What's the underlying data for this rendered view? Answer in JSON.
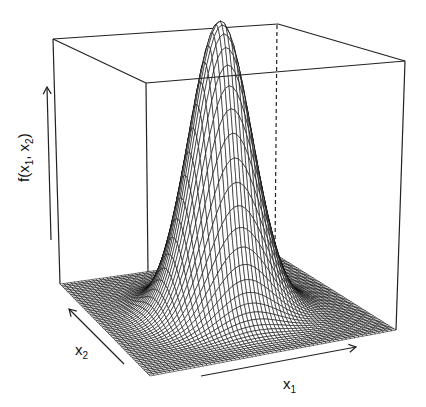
{
  "chart_data": {
    "type": "surface3d",
    "title": "",
    "function": "bivariate standard normal density f(x1, x2)",
    "xlabel": "x1",
    "ylabel": "x2",
    "zlabel": "f(x1, x2)",
    "axis_labels": {
      "x": {
        "base": "x",
        "sub": "1"
      },
      "y": {
        "base": "x",
        "sub": "2"
      },
      "z": {
        "base": "f(x",
        "sub1": "1",
        "mid": ", x",
        "sub2": "2",
        "end": ")"
      }
    },
    "ticks": "none",
    "grid": false,
    "box": true,
    "surface": {
      "peak_center": [
        0,
        0
      ],
      "sigma": 1,
      "range": [
        -4,
        4
      ],
      "grid_lines": 60,
      "style": "wireframe, white facets with black edges"
    },
    "colors": {
      "mesh_line": "#000000",
      "facet_fill": "#ffffff",
      "box_line": "#222222",
      "background": "#ffffff"
    }
  }
}
